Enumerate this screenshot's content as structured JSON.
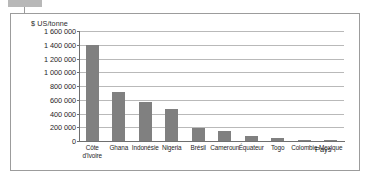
{
  "figure": {
    "frame_border_color": "#9c9c9c",
    "background": "#ffffff"
  },
  "chart_data": {
    "type": "bar",
    "title": "",
    "subtitle": "",
    "ylabel": "$ US/tonne",
    "xlabel": "Pays",
    "categories": [
      "Côte d'Ivoire",
      "Ghana",
      "Indonésie",
      "Nigeria",
      "Brésil",
      "Cameroun",
      "Équateur",
      "Togo",
      "Colombie",
      "Mexique"
    ],
    "values": [
      1400000,
      720000,
      565000,
      465000,
      195000,
      150000,
      75000,
      45000,
      20000,
      18000
    ],
    "ylim": [
      0,
      1600000
    ],
    "ytick_values": [
      0,
      200000,
      400000,
      600000,
      800000,
      1000000,
      1200000,
      1400000,
      1600000
    ],
    "ytick_labels": [
      "0",
      "200 000",
      "400 000",
      "600 000",
      "800 000",
      "1 000 000",
      "1 200 000",
      "1 400 000",
      "1 600 000"
    ],
    "grid": true,
    "grid_axis": "y",
    "legend": false,
    "legend_position": "none",
    "bar_color": "#808080",
    "gridline_color": "#b9b9b9",
    "axis_color": "#6f6f6f"
  },
  "labels": {
    "y_unit_caption": "$ US/tonne",
    "x_axis_title": "Pays",
    "category_display": [
      "Côte\nd'Ivoire",
      "Ghana",
      "Indonésie",
      "Nigeria",
      "Brésil",
      "Cameroun",
      "Équateur",
      "Togo",
      "Colombie",
      "Mexique"
    ]
  }
}
